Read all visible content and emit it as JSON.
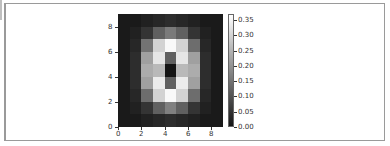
{
  "chart_data": {
    "type": "heatmap",
    "title": "",
    "xlabel": "",
    "ylabel": "",
    "colormap": "gray",
    "x_ticks": [
      "0",
      "2",
      "4",
      "6",
      "8"
    ],
    "y_ticks": [
      "0",
      "2",
      "4",
      "6",
      "8"
    ],
    "xlim": [
      0,
      9
    ],
    "ylim": [
      0,
      9
    ],
    "grid": false,
    "colorbar": {
      "ticks": [
        "0.00",
        "0.05",
        "0.10",
        "0.15",
        "0.20",
        "0.25",
        "0.30",
        "0.35"
      ],
      "range": [
        0.0,
        0.37
      ],
      "position": "right"
    },
    "rows_top_to_bottom": [
      [
        0.01,
        0.01,
        0.02,
        0.03,
        0.04,
        0.03,
        0.02,
        0.01,
        0.01
      ],
      [
        0.01,
        0.02,
        0.05,
        0.12,
        0.16,
        0.12,
        0.05,
        0.02,
        0.01
      ],
      [
        0.01,
        0.03,
        0.15,
        0.3,
        0.36,
        0.3,
        0.14,
        0.03,
        0.01
      ],
      [
        0.01,
        0.04,
        0.22,
        0.33,
        0.12,
        0.33,
        0.22,
        0.04,
        0.01
      ],
      [
        0.01,
        0.04,
        0.24,
        0.26,
        0.0,
        0.26,
        0.24,
        0.04,
        0.01
      ],
      [
        0.01,
        0.04,
        0.22,
        0.34,
        0.12,
        0.34,
        0.22,
        0.04,
        0.01
      ],
      [
        0.01,
        0.03,
        0.14,
        0.3,
        0.36,
        0.3,
        0.14,
        0.03,
        0.01
      ],
      [
        0.01,
        0.02,
        0.05,
        0.12,
        0.17,
        0.12,
        0.05,
        0.02,
        0.01
      ],
      [
        0.01,
        0.01,
        0.02,
        0.03,
        0.04,
        0.03,
        0.02,
        0.01,
        0.01
      ]
    ]
  }
}
